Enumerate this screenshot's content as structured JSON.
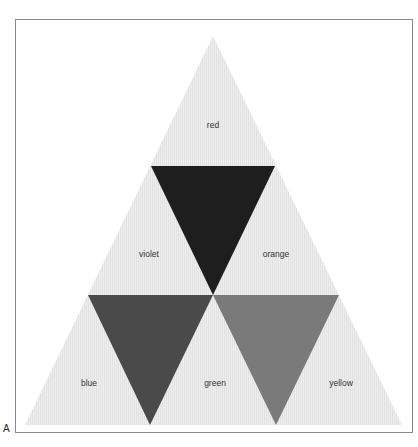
{
  "figure": {
    "label": "A"
  },
  "diagram": {
    "type": "color-triangle",
    "outer_fill": "#ececec",
    "hatch_color": "#dedede",
    "regions": [
      {
        "id": "red",
        "label": "red",
        "fill": "#ececec",
        "points": "213,36 151,166 275,166",
        "label_x": 213,
        "label_y": 128
      },
      {
        "id": "violet",
        "label": "violet",
        "fill": "#ececec",
        "points": "151,166 88,295 213,295",
        "label_x": 149,
        "label_y": 257
      },
      {
        "id": "orange",
        "label": "orange",
        "fill": "#ececec",
        "points": "275,166 213,295 339,295",
        "label_x": 276,
        "label_y": 257
      },
      {
        "id": "blue",
        "label": "blue",
        "fill": "#ececec",
        "points": "88,295 25,425 150,425",
        "label_x": 89,
        "label_y": 386
      },
      {
        "id": "green",
        "label": "green",
        "fill": "#ececec",
        "points": "213,295 150,425 276,425",
        "label_x": 215,
        "label_y": 386
      },
      {
        "id": "yellow",
        "label": "yellow",
        "fill": "#ececec",
        "points": "339,295 276,425 402,425",
        "label_x": 341,
        "label_y": 386
      }
    ],
    "mixes": [
      {
        "id": "mix-top",
        "fill": "#1e1e1e",
        "points": "151,166 275,166 213,295"
      },
      {
        "id": "mix-left",
        "fill": "#4a4a4a",
        "points": "88,295 213,295 150,425"
      },
      {
        "id": "mix-right",
        "fill": "#7a7a7a",
        "points": "213,295 339,295 276,425"
      }
    ]
  }
}
